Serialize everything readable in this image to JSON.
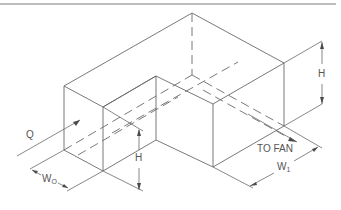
{
  "diagram": {
    "labels": {
      "flow": "Q",
      "height_right": "H",
      "height_left": "H",
      "outlet": "TO  FAN",
      "width_inlet_main": "W",
      "width_inlet_sub": "O",
      "width_outlet_main": "W",
      "width_outlet_sub": "1"
    },
    "colors": {
      "line": "#6a6a6a",
      "text": "#555555",
      "background": "#ffffff"
    }
  }
}
